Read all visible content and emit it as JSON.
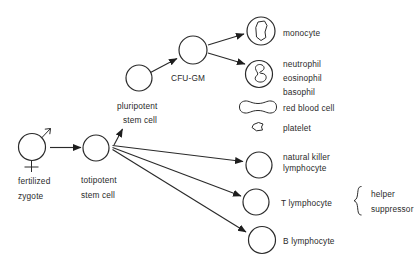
{
  "figure": {
    "background": "#ffffff",
    "ink": "#2a2a2a",
    "labels": {
      "fertilized_zygote": {
        "line1": "fertilized",
        "line2": "zygote"
      },
      "totipotent_stem_cell": {
        "line1": "totipotent",
        "line2": "stem cell"
      },
      "pluripotent_stem_cell": {
        "line1": "pluripotent",
        "line2": "stem cell"
      },
      "cfu_gm": "CFU-GM",
      "monocyte": "monocyte",
      "granulocytes": {
        "line1": "neutrophil",
        "line2": "eosinophil",
        "line3": "basophil"
      },
      "red_blood_cell": "red blood cell",
      "platelet": "platelet",
      "natural_killer": {
        "line1": "natural killer",
        "line2": "lymphocyte"
      },
      "t_lymphocyte": "T lymphocyte",
      "b_lymphocyte": "B lymphocyte",
      "t_cell_subtypes": {
        "line1": "helper",
        "line2": "suppressor"
      }
    },
    "icons": {
      "male_symbol": "♂ arrow on zygote cell",
      "female_symbol": "♀ cross under zygote cell",
      "cell_circle": "empty circle outline",
      "monocyte_nucleus": "irregular blob nucleus",
      "granulocyte_nucleus": "lobed squiggle nucleus",
      "red_blood_cell_shape": "biconcave disc side view",
      "platelet_shape": "small irregular fragment",
      "brace": "curly brace grouping helper/suppressor"
    }
  }
}
